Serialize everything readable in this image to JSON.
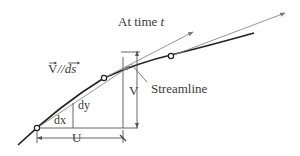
{
  "diagram": {
    "title": "At time",
    "title_var": "t",
    "parallel_label": "V//ds",
    "parallel_label_parts": {
      "v": "V",
      "sep": "//",
      "ds": "ds"
    },
    "streamline_label": "Streamline",
    "v_label": "V",
    "u_label": "U",
    "dx_label": "dx",
    "dy_label": "dy",
    "colors": {
      "streamline": "#222222",
      "tangent": "#888888",
      "construction": "#555555",
      "text": "#3a3a3a",
      "background": "#ffffff"
    },
    "points": [
      {
        "name": "point-1",
        "x": 37,
        "y": 128
      },
      {
        "name": "point-2",
        "x": 104,
        "y": 78
      },
      {
        "name": "point-3",
        "x": 171,
        "y": 56
      }
    ]
  }
}
